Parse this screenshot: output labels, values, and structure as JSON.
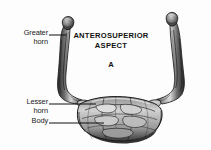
{
  "figure": {
    "title_lines": [
      "ANTEROSUPERIOR",
      "ASPECT"
    ],
    "panel_letter": "A",
    "background_color": "#fdfdfd",
    "ink_color": "#1a1a1a",
    "callouts": [
      {
        "id": "greater-horn",
        "lines": [
          "Greater",
          "horn"
        ],
        "line1": "Greater",
        "line2": "horn",
        "leader_from_x": 49,
        "leader_from_y": 35,
        "leader_to_x": 66,
        "leader_to_y": 35
      },
      {
        "id": "lesser-horn",
        "lines": [
          "Lesser",
          "horn"
        ],
        "line1": "Lesser",
        "line2": "horn",
        "leader_from_x": 49,
        "leader_from_y": 104,
        "leader_to_x": 96,
        "leader_to_y": 104
      },
      {
        "id": "body",
        "lines": [
          "Body"
        ],
        "line1": "Body",
        "leader_from_x": 49,
        "leader_from_y": 123,
        "leader_to_x": 104,
        "leader_to_y": 123
      }
    ]
  }
}
